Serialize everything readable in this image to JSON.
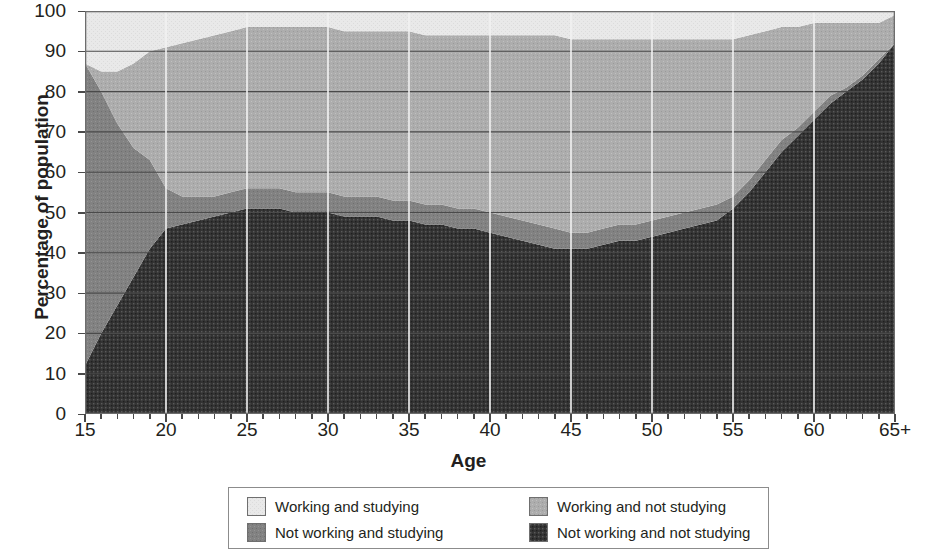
{
  "axes": {
    "ylabel": "Percentage of population",
    "xlabel": "Age",
    "yticks": [
      "100",
      "90",
      "80",
      "70",
      "60",
      "50",
      "40",
      "30",
      "20",
      "10",
      "0"
    ],
    "xticks": [
      "15",
      "20",
      "25",
      "30",
      "35",
      "40",
      "45",
      "50",
      "55",
      "60",
      "65+"
    ]
  },
  "legend": {
    "items": [
      {
        "label": "Working and studying",
        "color": "#e9e9e9"
      },
      {
        "label": "Not working and studying",
        "color": "#808080"
      },
      {
        "label": "Working and not studying",
        "color": "#ababab"
      },
      {
        "label": "Not working and not studying",
        "color": "#3a3a3a"
      }
    ]
  },
  "chart_data": {
    "type": "area",
    "title": "",
    "xlabel": "Age",
    "ylabel": "Percentage of population",
    "xlim": [
      15,
      65
    ],
    "ylim": [
      0,
      100
    ],
    "grid": true,
    "stacked": true,
    "stack_order_bottom_to_top": [
      "Not working and not studying",
      "Not working and studying",
      "Working and not studying",
      "Working and studying"
    ],
    "legend_position": "bottom",
    "x": [
      15,
      16,
      17,
      18,
      19,
      20,
      21,
      22,
      23,
      24,
      25,
      26,
      27,
      28,
      29,
      30,
      31,
      32,
      33,
      34,
      35,
      36,
      37,
      38,
      39,
      40,
      41,
      42,
      43,
      44,
      45,
      46,
      47,
      48,
      49,
      50,
      51,
      52,
      53,
      54,
      55,
      56,
      57,
      58,
      59,
      60,
      61,
      62,
      63,
      64,
      65
    ],
    "xtick_labels": [
      "15",
      "20",
      "25",
      "30",
      "35",
      "40",
      "45",
      "50",
      "55",
      "60",
      "65+"
    ],
    "series": [
      {
        "name": "Not working and not studying",
        "color": "#3a3a3a",
        "values": [
          12,
          20,
          27,
          34,
          41,
          46,
          47,
          48,
          49,
          50,
          51,
          51,
          51,
          50,
          50,
          50,
          49,
          49,
          49,
          48,
          48,
          47,
          47,
          46,
          46,
          45,
          44,
          43,
          42,
          41,
          41,
          41,
          42,
          43,
          43,
          44,
          45,
          46,
          47,
          48,
          51,
          55,
          60,
          65,
          69,
          73,
          77,
          80,
          83,
          87,
          92
        ]
      },
      {
        "name": "Not working and studying",
        "color": "#808080",
        "values": [
          75,
          60,
          45,
          32,
          22,
          10,
          7,
          6,
          5,
          5,
          5,
          5,
          5,
          5,
          5,
          5,
          5,
          5,
          5,
          5,
          5,
          5,
          5,
          5,
          5,
          5,
          5,
          5,
          5,
          5,
          4,
          4,
          4,
          4,
          4,
          4,
          4,
          4,
          4,
          4,
          3,
          3,
          3,
          3,
          2,
          2,
          2,
          1,
          1,
          1,
          0
        ]
      },
      {
        "name": "Working and not studying",
        "color": "#ababab",
        "values": [
          0,
          5,
          13,
          21,
          27,
          35,
          38,
          39,
          40,
          40,
          40,
          40,
          40,
          41,
          41,
          41,
          41,
          41,
          41,
          42,
          42,
          42,
          42,
          43,
          43,
          44,
          45,
          46,
          47,
          48,
          48,
          48,
          47,
          46,
          46,
          45,
          44,
          43,
          42,
          41,
          39,
          36,
          32,
          28,
          25,
          22,
          18,
          16,
          13,
          9,
          7
        ]
      },
      {
        "name": "Working and studying",
        "color": "#e9e9e9",
        "values": [
          13,
          15,
          15,
          13,
          10,
          9,
          8,
          7,
          6,
          5,
          4,
          4,
          4,
          4,
          4,
          4,
          5,
          5,
          5,
          5,
          5,
          6,
          6,
          6,
          6,
          6,
          6,
          6,
          6,
          6,
          7,
          7,
          7,
          7,
          7,
          7,
          7,
          7,
          7,
          7,
          7,
          6,
          5,
          4,
          4,
          3,
          3,
          3,
          3,
          3,
          1
        ]
      }
    ],
    "cumulative_tops": {
      "not_working_not_studying": [
        12,
        20,
        27,
        34,
        41,
        46,
        47,
        48,
        49,
        50,
        51,
        51,
        51,
        50,
        50,
        50,
        49,
        49,
        49,
        48,
        48,
        47,
        47,
        46,
        46,
        45,
        44,
        43,
        42,
        41,
        41,
        41,
        42,
        43,
        43,
        44,
        45,
        46,
        47,
        48,
        51,
        55,
        60,
        65,
        69,
        73,
        77,
        80,
        83,
        87,
        92
      ],
      "plus_not_working_studying": [
        87,
        80,
        72,
        66,
        63,
        56,
        54,
        54,
        54,
        55,
        56,
        56,
        56,
        55,
        55,
        55,
        54,
        54,
        54,
        53,
        53,
        52,
        52,
        51,
        51,
        50,
        49,
        48,
        47,
        46,
        45,
        45,
        46,
        47,
        47,
        48,
        49,
        50,
        51,
        52,
        54,
        58,
        63,
        68,
        71,
        75,
        79,
        81,
        84,
        88,
        92
      ],
      "plus_working_not_studying": [
        87,
        85,
        85,
        87,
        90,
        91,
        92,
        93,
        94,
        95,
        96,
        96,
        96,
        96,
        96,
        96,
        95,
        95,
        95,
        95,
        95,
        94,
        94,
        94,
        94,
        94,
        94,
        94,
        94,
        94,
        93,
        93,
        93,
        93,
        93,
        93,
        93,
        93,
        93,
        93,
        93,
        94,
        95,
        96,
        96,
        97,
        97,
        97,
        97,
        97,
        99
      ],
      "total": [
        100,
        100,
        100,
        100,
        100,
        100,
        100,
        100,
        100,
        100,
        100,
        100,
        100,
        100,
        100,
        100,
        100,
        100,
        100,
        100,
        100,
        100,
        100,
        100,
        100,
        100,
        100,
        100,
        100,
        100,
        100,
        100,
        100,
        100,
        100,
        100,
        100,
        100,
        100,
        100,
        100,
        100,
        100,
        100,
        100,
        100,
        100,
        100,
        100,
        100,
        100
      ]
    }
  }
}
